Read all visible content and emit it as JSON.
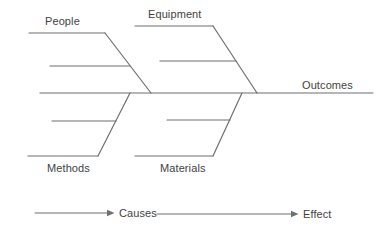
{
  "diagram": {
    "type": "fishbone",
    "outcome_label": "Outcomes",
    "top_branches": [
      {
        "label": "People"
      },
      {
        "label": "Equipment"
      }
    ],
    "bottom_branches": [
      {
        "label": "Methods"
      },
      {
        "label": "Materials"
      }
    ],
    "legend": {
      "causes_label": "Causes",
      "effect_label": "Effect"
    }
  },
  "colors": {
    "line": "#6f6f6f",
    "text": "#3f3f3f",
    "background": "#ffffff"
  }
}
